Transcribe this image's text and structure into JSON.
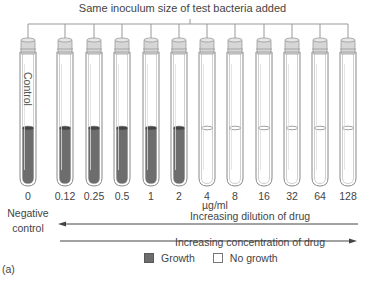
{
  "title": "Same inoculum size of test bacteria added",
  "tubes": [
    {
      "label": "0",
      "x": 28,
      "growth": true,
      "control": true
    },
    {
      "label": "0.12",
      "x": 65,
      "growth": true
    },
    {
      "label": "0.25",
      "x": 94,
      "growth": true
    },
    {
      "label": "0.5",
      "x": 122,
      "growth": true
    },
    {
      "label": "1",
      "x": 151,
      "growth": true
    },
    {
      "label": "2",
      "x": 179,
      "growth": true
    },
    {
      "label": "4",
      "x": 207,
      "growth": false
    },
    {
      "label": "8",
      "x": 235,
      "growth": false
    },
    {
      "label": "16",
      "x": 264,
      "growth": false
    },
    {
      "label": "32",
      "x": 292,
      "growth": false
    },
    {
      "label": "64",
      "x": 320,
      "growth": false
    },
    {
      "label": "128",
      "x": 348,
      "growth": false
    }
  ],
  "control_tube_text": "Control",
  "negative_control_label": [
    "Negative",
    "control"
  ],
  "unit": "µg/ml",
  "arrows": {
    "dilution": "Increasing dilution of drug",
    "concentration": "Increasing concentration of drug"
  },
  "legend": {
    "growth": "Growth",
    "no_growth": "No growth"
  },
  "figure_label": "(a)",
  "colors": {
    "growth": "#6d6d6d",
    "tube_outline": "#888888",
    "cap": "#d6d6d6"
  }
}
